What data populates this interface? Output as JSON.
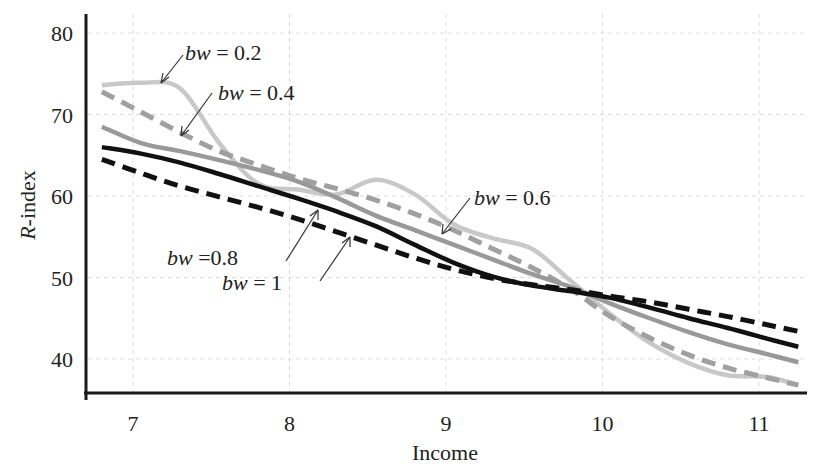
{
  "chart_data": {
    "type": "line",
    "title": "",
    "xlabel": "Income",
    "ylabel": "R-index",
    "xlim": [
      6.75,
      11.3
    ],
    "ylim": [
      36,
      82
    ],
    "xticks": [
      7,
      8,
      9,
      10,
      11
    ],
    "yticks": [
      40,
      50,
      60,
      70,
      80
    ],
    "grid": true,
    "legend": "inline annotations with arrows",
    "x": [
      6.75,
      7.0,
      7.25,
      7.5,
      7.75,
      8.0,
      8.25,
      8.5,
      8.75,
      9.0,
      9.25,
      9.5,
      9.75,
      10.0,
      10.25,
      10.5,
      10.75,
      11.0,
      11.2
    ],
    "series": [
      {
        "name": "bw = 0.2",
        "style": "solid",
        "color": "#c8c8c8",
        "values": [
          73.6,
          73.9,
          73.2,
          66.5,
          61.5,
          60.8,
          60.2,
          62.0,
          60.2,
          56.5,
          54.8,
          53.5,
          49.5,
          45.5,
          42.0,
          39.5,
          38.0,
          37.8,
          36.8
        ]
      },
      {
        "name": "bw = 0.4",
        "style": "dashed",
        "color": "#a0a0a0",
        "values": [
          72.8,
          70.3,
          67.8,
          65.5,
          63.8,
          62.2,
          60.9,
          59.5,
          57.8,
          55.8,
          53.5,
          51.2,
          48.5,
          45.2,
          42.6,
          40.5,
          38.9,
          37.7,
          36.8
        ]
      },
      {
        "name": "bw = 0.6",
        "style": "solid",
        "color": "#999999",
        "values": [
          68.5,
          66.5,
          65.5,
          64.4,
          63.2,
          61.8,
          59.8,
          57.6,
          55.8,
          54.0,
          52.2,
          50.4,
          48.8,
          46.8,
          45.0,
          43.3,
          41.8,
          40.6,
          39.6
        ]
      },
      {
        "name": "bw = 0.8",
        "style": "solid",
        "color": "#111111",
        "values": [
          66.0,
          65.2,
          64.1,
          62.7,
          61.2,
          59.7,
          58.1,
          56.3,
          54.0,
          51.8,
          50.1,
          49.0,
          48.3,
          47.5,
          46.3,
          45.0,
          43.8,
          42.5,
          41.5
        ]
      },
      {
        "name": "bw = 1",
        "style": "dashed",
        "color": "#111111",
        "values": [
          64.5,
          62.8,
          61.2,
          59.9,
          58.6,
          57.2,
          55.6,
          54.0,
          52.4,
          51.0,
          49.9,
          49.1,
          48.5,
          47.7,
          47.0,
          46.1,
          45.2,
          44.2,
          43.4
        ]
      }
    ],
    "annotations": [
      {
        "var": "bw",
        "op": " = ",
        "val": "0.2",
        "series": "bw = 0.2"
      },
      {
        "var": "bw",
        "op": " = ",
        "val": "0.4",
        "series": "bw = 0.4"
      },
      {
        "var": "bw",
        "op": " = ",
        "val": "0.6",
        "series": "bw = 0.6"
      },
      {
        "var": "bw",
        "op": " =",
        "val": "0.8",
        "series": "bw = 0.8"
      },
      {
        "var": "bw",
        "op": " = ",
        "val": "1",
        "series": "bw = 1"
      }
    ]
  },
  "axes": {
    "x_title": "Income",
    "y_title_italic": "R",
    "y_title_rest": "-index",
    "x_tick_labels": [
      "7",
      "8",
      "9",
      "10",
      "11"
    ],
    "y_tick_labels": [
      "40",
      "50",
      "60",
      "70",
      "80"
    ]
  }
}
